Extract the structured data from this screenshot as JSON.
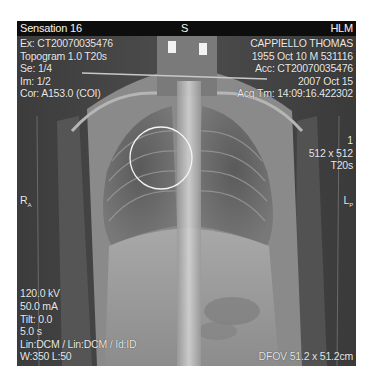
{
  "viewer": {
    "header": {
      "scanner": "Sensation 16",
      "orientation_top": "S",
      "institution": "HLM"
    },
    "top_left": [
      "Ex: CT20070035476",
      "Topogram  1.0  T20s",
      "Se: 1/4",
      "Im: 1/2",
      "Cor: A153.0 (COI)"
    ],
    "top_right": [
      "CAPPIELLO THOMAS",
      "1955 Oct 10  M  531116",
      "Acc: CT20070035476",
      "2007 Oct 15",
      "Acq Tm: 14:09:16.422302"
    ],
    "mid_right": [
      "1",
      "512 x 512",
      "T20s"
    ],
    "orientation_left_marker": "R",
    "orientation_left_sub": "A",
    "orientation_right_marker": "L",
    "orientation_right_sub": "P",
    "bottom_left": [
      "120.0 kV",
      "50.0 mA",
      "Tilt: 0.0",
      "5.0 s",
      "Lin:DCM / Lin:DCM / Id:ID",
      "W:350  L:50"
    ],
    "bottom_right": "DFOV 51.2 x 51.2cm",
    "roi_annotation": "circle"
  }
}
